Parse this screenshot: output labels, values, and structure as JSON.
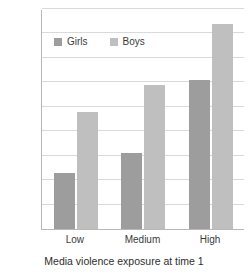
{
  "chart_data": {
    "type": "bar",
    "title": "",
    "xlabel": "Media violence exposure at time 1",
    "ylabel": "",
    "categories": [
      "Low",
      "Medium",
      "High"
    ],
    "series": [
      {
        "name": "Girls",
        "values": [
          23,
          31,
          61
        ],
        "color": "#9d9d9d"
      },
      {
        "name": "Boys",
        "values": [
          48,
          59,
          84
        ],
        "color": "#bfbfbf"
      }
    ],
    "ylim": [
      0,
      90
    ],
    "ytick_values": [
      0,
      10,
      20,
      30,
      40,
      50,
      60,
      70,
      80,
      90
    ],
    "ytick_labels": [
      "0",
      "10",
      "20",
      "30",
      "40",
      "50",
      "60",
      "70",
      "80",
      "90%"
    ],
    "grid": true,
    "legend_position": "top-left-inside"
  },
  "legend": {
    "items": [
      {
        "label": "Girls",
        "color": "#9d9d9d"
      },
      {
        "label": "Boys",
        "color": "#bfbfbf"
      }
    ]
  },
  "axes": {
    "x_title": "Media violence exposure at time 1",
    "x_tick_labels": [
      "Low",
      "Medium",
      "High"
    ],
    "y_tick_labels": [
      "0",
      "10",
      "20",
      "30",
      "40",
      "50",
      "60",
      "70",
      "80",
      "90%"
    ]
  }
}
